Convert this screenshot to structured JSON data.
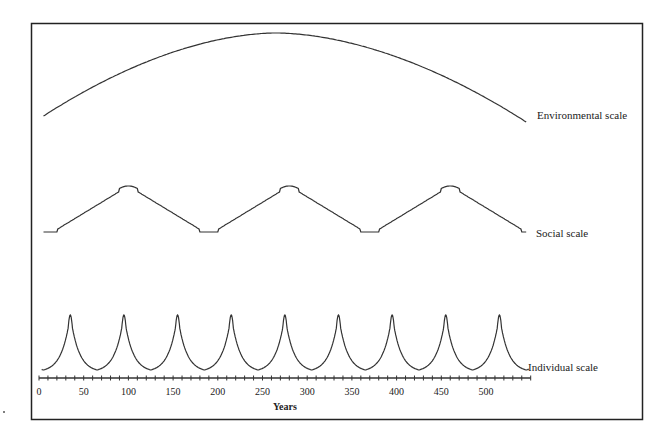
{
  "chart_data": {
    "type": "line",
    "title": "",
    "xlabel": "Years",
    "ylabel": "",
    "xlim": [
      0,
      550
    ],
    "x_ticks": [
      0,
      50,
      100,
      150,
      200,
      250,
      300,
      350,
      400,
      450,
      500
    ],
    "x_tick_labels": [
      "0",
      "50",
      "100",
      "150",
      "200",
      "250",
      "300",
      "350",
      "400",
      "450",
      "500"
    ],
    "minor_tick_step": 10,
    "grid": false,
    "legend": "inline labels at right end of each curve",
    "series": [
      {
        "name": "Environmental scale",
        "shape": "single broad arch",
        "start_year": 5,
        "peak_year": 265,
        "end_year": 545
      },
      {
        "name": "Social scale",
        "shape": "rounded triangular wave",
        "peaks_years": [
          100,
          280,
          460
        ],
        "troughs_years": [
          190,
          370
        ],
        "period_years": 180
      },
      {
        "name": "Individual scale",
        "shape": "sharp cusped peaks",
        "peaks_years": [
          35,
          100,
          160,
          220,
          280,
          340,
          400,
          460,
          520
        ],
        "troughs_years": [
          70,
          130,
          190,
          250,
          310,
          370,
          430,
          490
        ],
        "period_years": 60
      }
    ]
  },
  "labels": {
    "environmental": "Environmental scale",
    "social": "Social scale",
    "individual": "Individual scale",
    "xlabel": "Years"
  },
  "colors": {
    "line": "#333333",
    "frame": "#222222",
    "background": "#ffffff"
  }
}
